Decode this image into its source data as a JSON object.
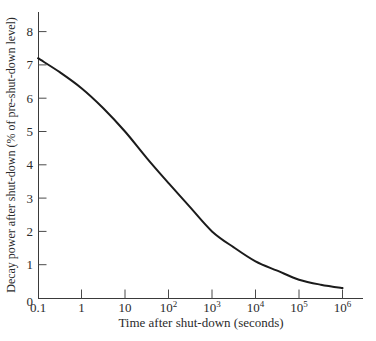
{
  "chart_data": {
    "type": "line",
    "title": "",
    "xlabel": "Time after shut-down (seconds)",
    "ylabel": "Decay power after shut-down (% of pre-shut-down level)",
    "x_scale": "log10",
    "x_tick_labels": [
      "0.1",
      "1",
      "10",
      "10^2",
      "10^3",
      "10^4",
      "10^5",
      "10^6"
    ],
    "x_tick_log_values": [
      -1,
      0,
      1,
      2,
      3,
      4,
      5,
      6
    ],
    "y_tick_labels": [
      "0",
      "1",
      "2",
      "3",
      "4",
      "5",
      "6",
      "7",
      "8"
    ],
    "y_tick_values": [
      0,
      1,
      2,
      3,
      4,
      5,
      6,
      7,
      8
    ],
    "xlim_log": [
      -1,
      6.45
    ],
    "ylim": [
      0,
      8.6
    ],
    "grid": false,
    "legend": false,
    "axis_color": "#3a3a3a",
    "text_color": "#2b2b2b",
    "series": [
      {
        "name": "decay-power",
        "color": "#1b1b1b",
        "stroke_width": 2,
        "x_log": [
          -1,
          -0.5,
          0,
          0.5,
          1,
          1.5,
          2,
          2.5,
          3,
          3.5,
          4,
          4.5,
          5,
          5.5,
          6
        ],
        "values": [
          7.2,
          6.78,
          6.3,
          5.7,
          5.0,
          4.2,
          3.45,
          2.72,
          2.0,
          1.52,
          1.1,
          0.82,
          0.55,
          0.4,
          0.3
        ]
      }
    ]
  }
}
